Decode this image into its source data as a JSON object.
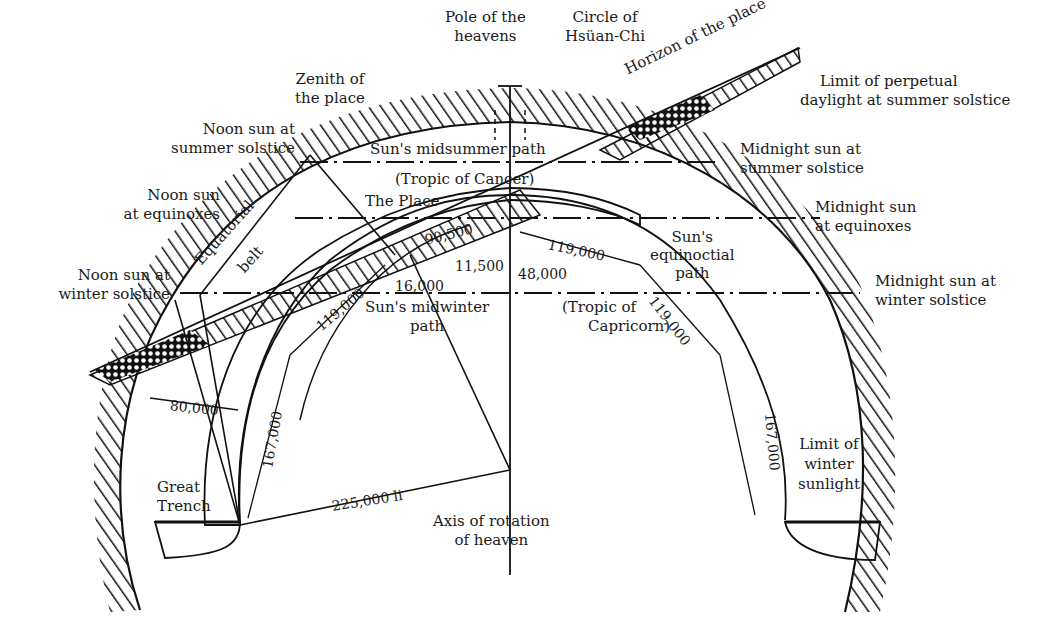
{
  "diagram": {
    "type": "cosmological cross-section diagram",
    "labels": {
      "pole_of_heavens": [
        "Pole of the",
        "heavens"
      ],
      "circle_hsuan_chi": [
        "Circle of",
        "Hsüan-Chi"
      ],
      "zenith": [
        "Zenith of",
        "the place"
      ],
      "horizon": "Horizon of the place",
      "limit_perpetual_daylight": [
        "Limit of perpetual",
        "daylight at summer solstice"
      ],
      "noon_summer": [
        "Noon sun at",
        "summer solstice"
      ],
      "noon_equinox": [
        "Noon sun",
        "at equinoxes"
      ],
      "noon_winter": [
        "Noon sun at",
        "winter solstice"
      ],
      "midnight_summer": [
        "Midnight sun at",
        "summer solstice"
      ],
      "midnight_equinox": [
        "Midnight sun",
        "at equinoxes"
      ],
      "midnight_winter": [
        "Midnight sun at",
        "winter solstice"
      ],
      "midsummer_path": "Sun's midsummer path",
      "tropic_cancer": "(Tropic of Cancer)",
      "the_place": "The Place",
      "equatorial_belt": [
        "Equatorial",
        "belt"
      ],
      "equinoctial_path": [
        "Sun's",
        "equinoctial",
        "path"
      ],
      "midwinter_path": [
        "Sun's midwinter",
        "path"
      ],
      "tropic_capricorn": [
        "(Tropic of",
        "Capricorn)"
      ],
      "great_trench": [
        "Great",
        "Trench"
      ],
      "axis_rotation": [
        "Axis of rotation",
        "of heaven"
      ],
      "limit_winter_sunlight": [
        "Limit of",
        "winter",
        "sunlight"
      ]
    },
    "measurements": {
      "m_90500": "90,500",
      "m_11500": "11,500",
      "m_48000": "48,000",
      "m_16000": "16,000",
      "m_119000_left": "119,000",
      "m_119000_right_a": "119,000",
      "m_119000_right_b": "119,000",
      "m_80000": "80,000",
      "m_167000_left": "167,000",
      "m_167000_right": "167,000",
      "m_225000": "225,000 li"
    }
  }
}
